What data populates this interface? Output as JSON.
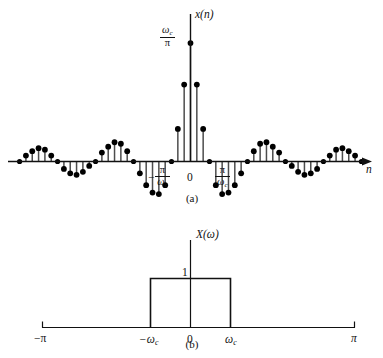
{
  "figure": {
    "panels": [
      {
        "id": "a",
        "caption": "(a)",
        "ylabel": "x(n)",
        "xlabel": "n",
        "origin_label": "0",
        "peak_label_num": "ω",
        "peak_label_num_sub": "c",
        "peak_label_den": "π",
        "left_tick_sign": "−",
        "tick_num": "π",
        "tick_den": "ω",
        "tick_den_sub": "c"
      },
      {
        "id": "b",
        "caption": "(b)",
        "ylabel": "X(ω)",
        "origin_label": "0",
        "amplitude_label": "1",
        "tick_left_pi": "−π",
        "tick_right_pi": "π",
        "tick_left_wc": "−ω",
        "tick_left_wc_sub": "c",
        "tick_right_wc": "ω",
        "tick_right_wc_sub": "c"
      }
    ],
    "colors": {
      "ink": "#111111",
      "stem": "#4d4d4d",
      "marker": "#000000"
    }
  },
  "chart_data": [
    {
      "type": "scatter",
      "subtype": "stem",
      "panel": "a",
      "title": "x(n)",
      "xlabel": "n",
      "ylabel": "x(n)",
      "description": "Ideal lowpass filter impulse response, sinc sequence x(n) = (omega_c/pi) * sin(omega_c n)/(omega_c n)",
      "peak_value_label": "ωc/π",
      "zero_crossing_labels": [
        "−π/ωc",
        "π/ωc"
      ],
      "grid": false,
      "legend": false,
      "ylim": [
        -0.3,
        1.0
      ],
      "xlim": [
        -28,
        28
      ],
      "x": [
        -27,
        -26,
        -25,
        -24,
        -23,
        -22,
        -21,
        -20,
        -19,
        -18,
        -17,
        -16,
        -15,
        -14,
        -13,
        -12,
        -11,
        -10,
        -9,
        -8,
        -7,
        -6,
        -5,
        -4,
        -3,
        -2,
        -1,
        0,
        1,
        2,
        3,
        4,
        5,
        6,
        7,
        8,
        9,
        10,
        11,
        12,
        13,
        14,
        15,
        16,
        17,
        18,
        19,
        20,
        21,
        22,
        23,
        24,
        25,
        26,
        27
      ],
      "values": [
        0.0,
        0.04,
        0.07,
        0.09,
        0.08,
        0.04,
        0.0,
        -0.05,
        -0.08,
        -0.09,
        -0.07,
        -0.03,
        0.0,
        0.06,
        0.1,
        0.13,
        0.12,
        0.07,
        0.0,
        -0.08,
        -0.16,
        -0.21,
        -0.22,
        -0.16,
        0.0,
        0.22,
        0.52,
        0.8,
        0.52,
        0.22,
        0.0,
        -0.16,
        -0.22,
        -0.21,
        -0.16,
        -0.08,
        0.0,
        0.07,
        0.12,
        0.13,
        0.1,
        0.06,
        0.0,
        -0.03,
        -0.07,
        -0.09,
        -0.08,
        -0.05,
        0.0,
        0.04,
        0.08,
        0.09,
        0.07,
        0.04,
        0.0
      ]
    },
    {
      "type": "line",
      "subtype": "rectangular-pulse",
      "panel": "b",
      "title": "X(ω)",
      "xlabel": "ω",
      "ylabel": "X(ω)",
      "description": "Ideal lowpass frequency response: X(omega)=1 for |omega|<omega_c, 0 otherwise",
      "grid": false,
      "legend": false,
      "xlim": [
        -3.14159,
        3.14159
      ],
      "ylim": [
        0,
        1.35
      ],
      "xticks": [
        "−π",
        "−ωc",
        "0",
        "ωc",
        "π"
      ],
      "xtick_values": [
        -3.14159,
        -1.05,
        0,
        1.05,
        3.14159
      ],
      "x": [
        -3.14159,
        -1.05,
        -1.05,
        1.05,
        1.05,
        3.14159
      ],
      "values": [
        0,
        0,
        1,
        1,
        0,
        0
      ],
      "amplitude": 1
    }
  ]
}
